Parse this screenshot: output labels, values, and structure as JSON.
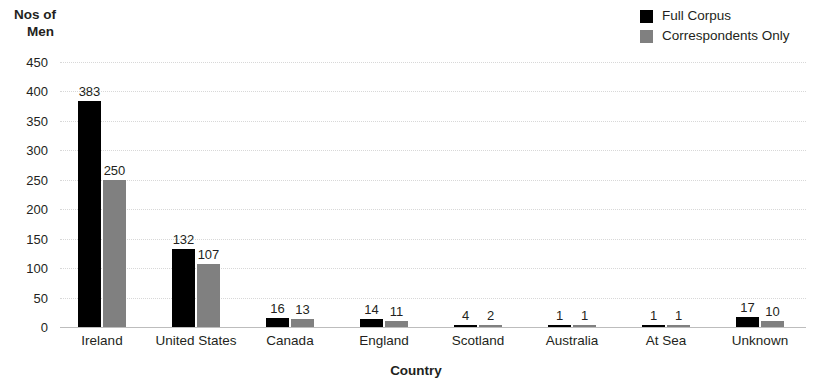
{
  "chart_data": {
    "type": "bar",
    "title": "",
    "xlabel": "Country",
    "ylabel": "Nos of Men",
    "ylabel_line1": "Nos of",
    "ylabel_line2": "Men",
    "categories": [
      "Ireland",
      "United States",
      "Canada",
      "England",
      "Scotland",
      "Australia",
      "At Sea",
      "Unknown"
    ],
    "series": [
      {
        "name": "Full Corpus",
        "color": "#000000",
        "values": [
          383,
          132,
          16,
          14,
          4,
          1,
          1,
          17
        ]
      },
      {
        "name": "Correspondents Only",
        "color": "#808080",
        "values": [
          250,
          107,
          13,
          11,
          2,
          1,
          1,
          10
        ]
      }
    ],
    "ylim": [
      0,
      450
    ],
    "yticks": [
      450,
      400,
      350,
      300,
      250,
      200,
      150,
      100,
      50,
      0
    ],
    "ytick_labels": [
      "450",
      "400",
      "350",
      "300",
      "250",
      "200",
      "150",
      "100",
      "50",
      "0"
    ],
    "grid": true,
    "grid_style": "dotted-horizontal",
    "legend_position": "top-right",
    "data_labels": true,
    "background": "#ffffff",
    "text_color": "#231f20"
  },
  "legend": {
    "entries": [
      {
        "label": "Full Corpus",
        "swatch": "#000000"
      },
      {
        "label": "Correspondents Only",
        "swatch": "#808080"
      }
    ]
  }
}
